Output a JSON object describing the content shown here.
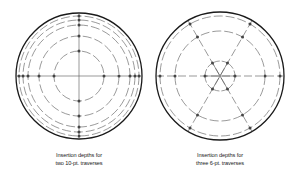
{
  "colors": {
    "background": "#ffffff",
    "outline": "#1a1a1a",
    "line": "#555555",
    "dot": "#444444",
    "text": "#222222"
  },
  "figures": [
    {
      "id": "left",
      "caption": {
        "line1": "Insertion depths for",
        "line2": "two 10-pt. traverses"
      },
      "center": [
        79,
        76
      ],
      "outer_radius": 63,
      "traverse_angles_deg": [
        0,
        90
      ],
      "point_radii": [
        25,
        40,
        51,
        56,
        60
      ],
      "ring_radii": [
        25,
        40,
        51,
        56,
        60
      ],
      "points_per_traverse": 10,
      "traverse_count": 2
    },
    {
      "id": "right",
      "caption": {
        "line1": "Insertion depths for",
        "line2": "three 6-pt. traverses"
      },
      "center": [
        220,
        76
      ],
      "outer_radius": 64,
      "traverse_angles_deg": [
        0,
        60,
        120
      ],
      "point_radii": [
        15,
        45,
        60
      ],
      "ring_radii": [
        15,
        45,
        60
      ],
      "points_per_traverse": 6,
      "traverse_count": 3
    }
  ]
}
